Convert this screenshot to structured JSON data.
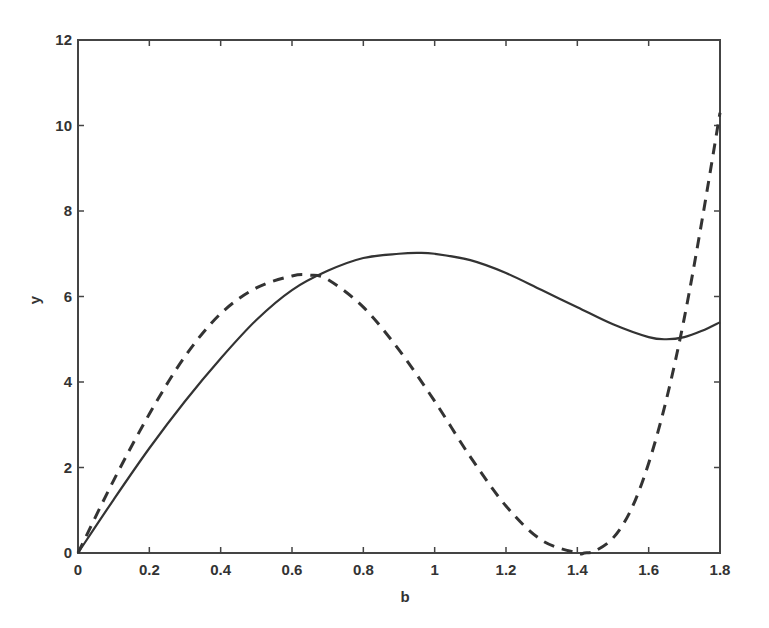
{
  "chart_data": {
    "type": "line",
    "title": "",
    "xlabel": "b",
    "ylabel": "y",
    "xlim": [
      0,
      1.8
    ],
    "ylim": [
      0,
      12
    ],
    "grid": false,
    "legend": null,
    "xticks": [
      "0",
      "0.2",
      "0.4",
      "0.6",
      "0.8",
      "1",
      "1.2",
      "1.4",
      "1.6",
      "1.8"
    ],
    "yticks": [
      "0",
      "2",
      "4",
      "6",
      "8",
      "10",
      "12"
    ],
    "series": [
      {
        "name": "solid",
        "style": "solid",
        "x": [
          0,
          0.1,
          0.2,
          0.3,
          0.4,
          0.5,
          0.6,
          0.7,
          0.8,
          0.9,
          0.95,
          1.0,
          1.1,
          1.2,
          1.3,
          1.4,
          1.5,
          1.6,
          1.65,
          1.7,
          1.75,
          1.8
        ],
        "y": [
          0,
          1.25,
          2.45,
          3.55,
          4.55,
          5.45,
          6.15,
          6.6,
          6.9,
          7.0,
          7.02,
          7.0,
          6.85,
          6.55,
          6.15,
          5.75,
          5.35,
          5.05,
          5.0,
          5.05,
          5.2,
          5.4
        ]
      },
      {
        "name": "dashed",
        "style": "dashed",
        "x": [
          0,
          0.1,
          0.2,
          0.3,
          0.4,
          0.5,
          0.6,
          0.65,
          0.7,
          0.8,
          0.9,
          1.0,
          1.1,
          1.2,
          1.3,
          1.4,
          1.42,
          1.45,
          1.5,
          1.55,
          1.6,
          1.65,
          1.7,
          1.75,
          1.8
        ],
        "y": [
          0,
          1.7,
          3.25,
          4.6,
          5.6,
          6.2,
          6.48,
          6.5,
          6.4,
          5.75,
          4.75,
          3.55,
          2.25,
          1.1,
          0.3,
          0.0,
          0.0,
          0.05,
          0.35,
          1.0,
          2.1,
          3.6,
          5.5,
          7.8,
          10.3
        ]
      }
    ]
  },
  "axes": {
    "x_label": "b",
    "y_label": "y"
  },
  "colors": {
    "line": "#333333",
    "axis": "#444444",
    "background": "#ffffff"
  }
}
